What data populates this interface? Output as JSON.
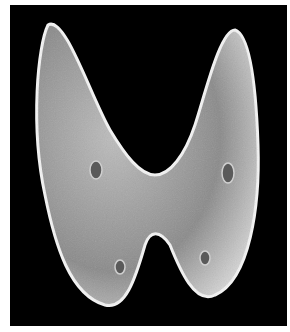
{
  "image": {
    "subject": "scanning electron micrograph of a bilobed specimen",
    "background_color": "#000000",
    "frame_color": "#ffffff"
  }
}
